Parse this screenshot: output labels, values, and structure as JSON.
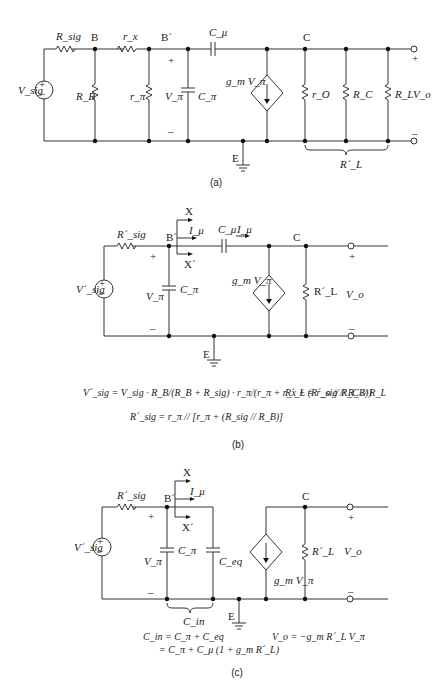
{
  "figure_a": {
    "caption": "(a)",
    "nodes": {
      "B": "B",
      "B_prime": "B´",
      "C": "C",
      "E": "E"
    },
    "components": {
      "source": "V_sig",
      "R_sig": "R_sig",
      "R_B": "R_B",
      "r_x": "r_x",
      "r_pi": "r_π",
      "V_pi": "V_π",
      "C_pi": "C_π",
      "C_mu": "C_μ",
      "gm": "g_m V_π",
      "r_o": "r_O",
      "R_C": "R_C",
      "R_L": "R_L",
      "V_o": "V_o",
      "R_L_prime": "R´_L"
    },
    "polarity": {
      "plus": "+",
      "minus": "–"
    }
  },
  "figure_b": {
    "caption": "(b)",
    "nodes": {
      "B_prime": "B´",
      "C": "C",
      "E": "E",
      "X": "X",
      "X_prime": "X´"
    },
    "components": {
      "source": "V´_sig",
      "R_sig_prime": "R´_sig",
      "V_pi": "V_π",
      "C_pi": "C_π",
      "C_mu": "C_μ",
      "I_mu": "I_μ",
      "gm": "g_m V_π",
      "R_L_prime": "R´_L",
      "V_o": "V_o"
    },
    "equations": {
      "vsig": "V´_sig = V_sig · R_B/(R_B + R_sig) · r_π/(r_π + r_x + (R´_sig // R_B))",
      "rl": "R´_L = r_o // R_C // R_L",
      "rsig": "R´_sig = r_π // [r_π + (R_sig // R_B)]"
    }
  },
  "figure_c": {
    "caption": "(c)",
    "nodes": {
      "B_prime": "B´",
      "C": "C",
      "E": "E",
      "X": "X",
      "X_prime": "X´"
    },
    "components": {
      "source": "V´_sig",
      "R_sig_prime": "R´_sig",
      "V_pi": "V_π",
      "C_pi": "C_π",
      "C_eq": "C_eq",
      "C_in": "C_in",
      "I_mu": "I_μ",
      "gm": "g_m V_π",
      "R_L_prime": "R´_L",
      "V_o": "V_o"
    },
    "equations": {
      "cin1": "C_in = C_π + C_eq",
      "cin2": "= C_π + C_μ (1 + g_m R´_L)",
      "vo": "V_o = −g_m R´_L V_π"
    }
  }
}
